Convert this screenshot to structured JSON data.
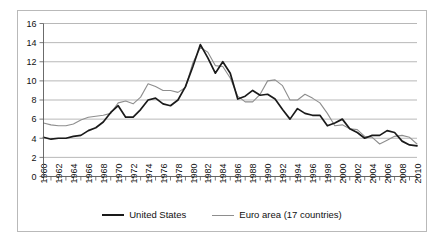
{
  "chart_data": {
    "type": "line",
    "title": "",
    "xlabel": "",
    "ylabel": "",
    "ylim": [
      0,
      16
    ],
    "ytick_step": 2,
    "yticks": [
      "0",
      "2",
      "4",
      "6",
      "8",
      "10",
      "12",
      "14",
      "16"
    ],
    "xlim": [
      1960,
      2010
    ],
    "grid": true,
    "legend_position": "bottom-center",
    "x": [
      1960,
      1961,
      1962,
      1963,
      1964,
      1965,
      1966,
      1967,
      1968,
      1969,
      1970,
      1971,
      1972,
      1973,
      1974,
      1975,
      1976,
      1977,
      1978,
      1979,
      1980,
      1981,
      1982,
      1983,
      1984,
      1985,
      1986,
      1987,
      1988,
      1989,
      1990,
      1991,
      1992,
      1993,
      1994,
      1995,
      1996,
      1997,
      1998,
      1999,
      2000,
      2001,
      2002,
      2003,
      2004,
      2005,
      2006,
      2007,
      2008,
      2009,
      2010
    ],
    "xtick_labels": [
      "1960",
      "1962",
      "1964",
      "1966",
      "1968",
      "1970",
      "1972",
      "1974",
      "1976",
      "1978",
      "1980",
      "1982",
      "1984",
      "1986",
      "1988",
      "1990",
      "1992",
      "1994",
      "1996",
      "1998",
      "2000",
      "2002",
      "2004",
      "2006",
      "2008",
      "2010"
    ],
    "series": [
      {
        "name": "United States",
        "color": "#1a1a1a",
        "values": [
          4.1,
          3.9,
          4.0,
          4.0,
          4.2,
          4.3,
          4.8,
          5.1,
          5.7,
          6.7,
          7.4,
          6.2,
          6.2,
          7.0,
          8.0,
          8.2,
          7.6,
          7.4,
          8.0,
          9.4,
          11.5,
          13.8,
          12.4,
          10.8,
          12.0,
          10.8,
          8.1,
          8.4,
          9.0,
          8.5,
          8.6,
          8.1,
          7.0,
          6.0,
          7.1,
          6.6,
          6.4,
          6.4,
          5.3,
          5.6,
          6.0,
          5.0,
          4.6,
          4.0,
          4.3,
          4.3,
          4.8,
          4.6,
          3.7,
          3.3,
          3.2
        ]
      },
      {
        "name": "Euro area (17 countries)",
        "color": "#8e8e8e",
        "values": [
          5.6,
          5.4,
          5.3,
          5.3,
          5.5,
          5.9,
          6.2,
          6.3,
          6.4,
          6.6,
          7.7,
          7.9,
          7.6,
          8.3,
          9.7,
          9.4,
          9.0,
          9.0,
          8.8,
          9.3,
          11.9,
          13.5,
          13.0,
          11.6,
          11.5,
          10.3,
          8.4,
          7.8,
          7.8,
          8.6,
          10.0,
          10.1,
          9.5,
          8.0,
          8.0,
          8.6,
          8.2,
          7.7,
          6.6,
          5.3,
          5.4,
          5.0,
          4.9,
          4.2,
          4.1,
          3.4,
          3.8,
          4.2,
          4.3,
          4.1,
          3.4
        ]
      }
    ]
  },
  "legend": {
    "us_label": "United States",
    "eu_label": "Euro area (17 countries)"
  }
}
